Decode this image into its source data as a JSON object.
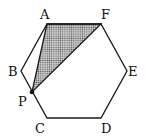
{
  "figure": {
    "type": "regular hexagon with shaded triangle",
    "vertices": {
      "A": {
        "label": "A",
        "x": 47,
        "y": 24
      },
      "F": {
        "label": "F",
        "x": 101,
        "y": 24
      },
      "E": {
        "label": "E",
        "x": 127,
        "y": 71
      },
      "D": {
        "label": "D",
        "x": 101,
        "y": 118
      },
      "C": {
        "label": "C",
        "x": 47,
        "y": 118
      },
      "B": {
        "label": "B",
        "x": 21,
        "y": 71
      }
    },
    "point_P": {
      "label": "P",
      "x": 32,
      "y": 92,
      "on_segment": "BC"
    },
    "shaded_triangle": [
      "A",
      "F",
      "P"
    ],
    "colors": {
      "stroke": "#1a1a1a",
      "shade_dots": "#555555",
      "background": "#ffffff"
    }
  }
}
